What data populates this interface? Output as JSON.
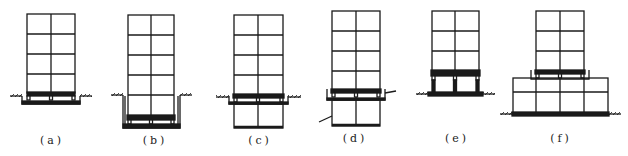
{
  "figure": {
    "panels": [
      {
        "id": "a",
        "label": "(a)",
        "cx": 52,
        "isolation": "foundation level in shallow pit"
      },
      {
        "id": "b",
        "label": "(b)",
        "cx": 152,
        "isolation": "bottom of deep retaining pit"
      },
      {
        "id": "c",
        "label": "(c)",
        "cx": 258,
        "isolation": "top of basement"
      },
      {
        "id": "d",
        "label": "(d)",
        "cx": 355,
        "isolation": "mid-height, above basement story"
      },
      {
        "id": "e",
        "label": "(e)",
        "cx": 455,
        "isolation": "top of ground-story columns"
      },
      {
        "id": "f",
        "label": "(f)",
        "cx": 560,
        "isolation": "on top of podium"
      }
    ]
  },
  "colors": {
    "line": "#1a1a1a",
    "background": "#ffffff"
  }
}
